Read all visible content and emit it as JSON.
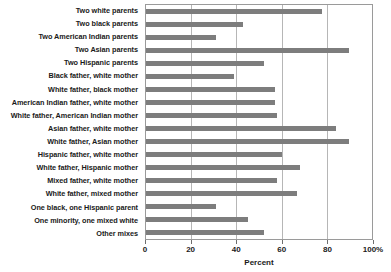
{
  "chart_data": {
    "type": "bar",
    "orientation": "horizontal",
    "title": "",
    "xlabel": "Percent",
    "ylabel": "",
    "xlim": [
      0,
      100
    ],
    "xticks": [
      0,
      20,
      40,
      60,
      80,
      100
    ],
    "xtick_labels": [
      "0",
      "20",
      "40",
      "60",
      "80",
      "100%"
    ],
    "grid": true,
    "legend": false,
    "bar_color": "#7d7d7d",
    "categories": [
      "Two white parents",
      "Two black parents",
      "Two American Indian parents",
      "Two Asian parents",
      "Two Hispanic parents",
      "Black father, white mother",
      "White father, black mother",
      "American Indian father, white mother",
      "White father, American Indian mother",
      "Asian father, white mother",
      "White father, Asian mother",
      "Hispanic father, white mother",
      "White father, Hispanic mother",
      "Mixed father, white mother",
      "White father, mixed mother",
      "One black, one Hispanic parent",
      "One minority, one mixed white",
      "Other mixes"
    ],
    "values": [
      78,
      43,
      31,
      90,
      52,
      39,
      57,
      57,
      58,
      84,
      90,
      60,
      68,
      58,
      67,
      31,
      45,
      52
    ]
  }
}
